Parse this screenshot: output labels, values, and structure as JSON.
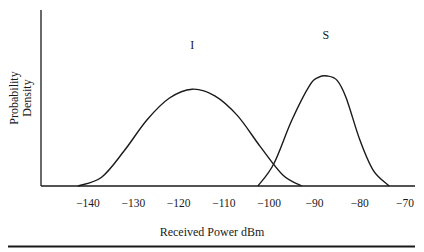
{
  "chart_data": {
    "type": "line",
    "title": "",
    "xlabel": "Received Power dBm",
    "ylabel": "Probability Density",
    "ylabel_lines": [
      "Probability",
      "Density"
    ],
    "xlim": [
      -142.5,
      -68
    ],
    "x_ticks": [
      -140,
      -130,
      -120,
      -110,
      -100,
      -90,
      -80,
      -70
    ],
    "x_tick_labels": [
      "−140",
      "−130",
      "−120",
      "−110",
      "−100",
      "−90",
      "−80",
      "−70"
    ],
    "y_ticks": [],
    "grid": false,
    "legend": "none",
    "series": [
      {
        "name": "I",
        "label": "I",
        "label_pos": {
          "x": -117,
          "y": 1.28
        },
        "shape": "bell",
        "x": [
          -142.2,
          -137,
          -132,
          -127,
          -122,
          -117,
          -112,
          -107,
          -102,
          -97,
          -92.8
        ],
        "y": [
          0.0,
          0.08,
          0.32,
          0.6,
          0.8,
          0.88,
          0.82,
          0.64,
          0.36,
          0.1,
          0.0
        ]
      },
      {
        "name": "S",
        "label": "S",
        "label_pos": {
          "x": -87.5,
          "y": 1.37
        },
        "shape": "bell",
        "x": [
          -102.5,
          -99,
          -95,
          -91,
          -89,
          -87.2,
          -85,
          -83,
          -80,
          -77,
          -73.5
        ],
        "y": [
          0.0,
          0.2,
          0.6,
          0.92,
          0.99,
          1.0,
          0.96,
          0.8,
          0.42,
          0.14,
          0.0
        ]
      }
    ]
  },
  "caption_rule": true
}
